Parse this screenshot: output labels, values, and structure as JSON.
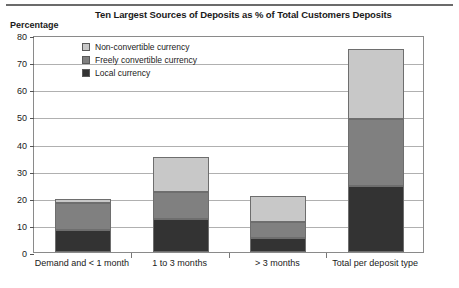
{
  "chart_data": {
    "type": "bar",
    "subtype": "stacked-bar",
    "title": "Ten Largest Sources of Deposits as % of Total Customers Deposits",
    "ylabel": "Percentage",
    "xlabel": "",
    "ylim": [
      0,
      80
    ],
    "yticks": [
      0,
      10,
      20,
      30,
      40,
      50,
      60,
      70,
      80
    ],
    "grid": true,
    "legend_position": "inside-top-left",
    "categories": [
      "Demand and < 1 month",
      "1 to 3 months",
      "> 3 months",
      "Total per deposit type"
    ],
    "series": [
      {
        "name": "Local currency",
        "color": "#333333",
        "values": [
          8,
          12,
          5,
          24.5
        ]
      },
      {
        "name": "Freely convertible currency",
        "color": "#808080",
        "values": [
          10,
          10,
          6,
          24.5
        ]
      },
      {
        "name": "Non-convertible currency",
        "color": "#c8c8c8",
        "values": [
          1.5,
          13,
          9.5,
          26
        ]
      }
    ],
    "totals": [
      19.5,
      35,
      20.5,
      75
    ]
  },
  "legend": {
    "items": [
      {
        "label": "Non-convertible currency",
        "color": "#c8c8c8"
      },
      {
        "label": "Freely convertible currency",
        "color": "#808080"
      },
      {
        "label": "Local currency",
        "color": "#333333"
      }
    ]
  },
  "axis": {
    "y_caption": "Percentage"
  }
}
